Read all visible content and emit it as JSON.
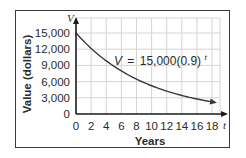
{
  "chart_data": {
    "type": "line",
    "title": "",
    "xlabel": "Years",
    "ylabel": "Value (dollars)",
    "x_axis_variable": "t",
    "y_axis_variable": "V",
    "equation": {
      "lhs": "V",
      "equals": "=",
      "rhs": "15,000(0.9)",
      "exponent": "t"
    },
    "x_ticks": [
      "0",
      "2",
      "4",
      "6",
      "8",
      "10",
      "12",
      "14",
      "16",
      "18"
    ],
    "y_ticks": [
      "0",
      "3,000",
      "6,000",
      "9,000",
      "12,000",
      "15,000"
    ],
    "xlim": [
      0,
      19
    ],
    "ylim": [
      0,
      16500
    ],
    "grid": true,
    "legend": "none",
    "series": [
      {
        "name": "V = 15,000(0.9)^t",
        "x": [
          0,
          2,
          4,
          6,
          8,
          10,
          12,
          14,
          16,
          18
        ],
        "values": [
          15000,
          12150,
          9842,
          7972,
          6457,
          5230,
          4237,
          3432,
          2780,
          2252
        ]
      }
    ]
  },
  "colors": {
    "curve": "#3a3a3a",
    "axis": "#1a1a1a",
    "grid": "#d4d4d4",
    "frame": "#3a3a3a",
    "text": "#2b2b2b"
  }
}
